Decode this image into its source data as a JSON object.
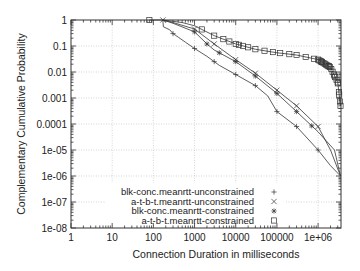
{
  "chart_data": {
    "type": "line",
    "title": "",
    "xlabel": "Connection Duration in milliseconds",
    "ylabel": "Complementary Cumulative Probability",
    "xscale": "log",
    "yscale": "log",
    "xlim": [
      1,
      3600000
    ],
    "ylim": [
      1e-08,
      1
    ],
    "grid": true,
    "legend_position": "bottom-center",
    "x_ticks": [
      {
        "value": 1,
        "label": "1"
      },
      {
        "value": 10,
        "label": "10"
      },
      {
        "value": 100,
        "label": "100"
      },
      {
        "value": 1000,
        "label": "1000"
      },
      {
        "value": 10000,
        "label": "10000"
      },
      {
        "value": 100000,
        "label": "100000"
      },
      {
        "value": 1000000,
        "label": "1e+06"
      }
    ],
    "y_ticks": [
      {
        "value": 1,
        "label": "1"
      },
      {
        "value": 0.1,
        "label": "0.1"
      },
      {
        "value": 0.01,
        "label": "0.01"
      },
      {
        "value": 0.001,
        "label": "0.001"
      },
      {
        "value": 0.0001,
        "label": "0.0001"
      },
      {
        "value": 1e-05,
        "label": "1e-05"
      },
      {
        "value": 1e-06,
        "label": "1e-06"
      },
      {
        "value": 1e-07,
        "label": "1e-07"
      },
      {
        "value": 1e-08,
        "label": "1e-08"
      }
    ],
    "series": [
      {
        "name": "blk-conc.meanrtt-unconstrained",
        "marker": "plus",
        "points": [
          [
            170,
            1
          ],
          [
            175,
            0.55
          ],
          [
            250,
            0.42
          ],
          [
            300,
            0.3
          ],
          [
            400,
            0.22
          ],
          [
            600,
            0.14
          ],
          [
            1000,
            0.08
          ],
          [
            2000,
            0.04
          ],
          [
            4000,
            0.018
          ],
          [
            10000,
            0.008
          ],
          [
            30000,
            0.003
          ],
          [
            60000,
            0.0012
          ],
          [
            100000,
            0.0003
          ],
          [
            300000,
            8e-05
          ],
          [
            1000000,
            1e-05
          ],
          [
            2000000,
            2.5e-06
          ],
          [
            3500000,
            1e-06
          ]
        ],
        "marker_x": [
          300,
          1000,
          3000,
          10000,
          30000,
          100000,
          300000,
          1000000
        ]
      },
      {
        "name": "a-t-b-t.meanrtt-unconstrained",
        "marker": "cross",
        "points": [
          [
            170,
            1
          ],
          [
            300,
            0.8
          ],
          [
            1000,
            0.45
          ],
          [
            3000,
            0.12
          ],
          [
            10000,
            0.03
          ],
          [
            30000,
            0.009
          ],
          [
            100000,
            0.002
          ],
          [
            300000,
            0.0005
          ],
          [
            1000000,
            8e-05
          ],
          [
            2000000,
            1e-05
          ],
          [
            3500000,
            1e-06
          ]
        ],
        "marker_x": [
          170,
          1000,
          3000,
          10000,
          30000,
          100000,
          300000,
          1000000
        ]
      },
      {
        "name": "blk-conc.meanrtt-constrained",
        "marker": "star",
        "points": [
          [
            170,
            1
          ],
          [
            300,
            0.75
          ],
          [
            1000,
            0.35
          ],
          [
            2000,
            0.12
          ],
          [
            3000,
            0.07
          ],
          [
            10000,
            0.025
          ],
          [
            30000,
            0.007
          ],
          [
            100000,
            0.0015
          ],
          [
            300000,
            0.0003
          ],
          [
            1000000,
            5e-05
          ],
          [
            2500000,
            1e-05
          ],
          [
            3500000,
            1e-06
          ]
        ],
        "marker_x": [
          1000,
          2000,
          4000,
          10000,
          30000,
          100000,
          300000,
          700000
        ]
      },
      {
        "name": "a-t-b-t.meanrtt-constrained",
        "marker": "square",
        "points": [
          [
            80,
            1
          ],
          [
            170,
            1
          ],
          [
            500,
            0.8
          ],
          [
            1000,
            0.6
          ],
          [
            3000,
            0.25
          ],
          [
            10000,
            0.12
          ],
          [
            30000,
            0.075
          ],
          [
            100000,
            0.055
          ],
          [
            300000,
            0.045
          ],
          [
            1000000,
            0.03
          ],
          [
            2000000,
            0.015
          ],
          [
            3000000,
            0.004
          ],
          [
            3500000,
            0.0005
          ]
        ],
        "marker_x": [
          80,
          1500,
          3000,
          5000,
          7000,
          10000,
          12000,
          15000,
          20000,
          30000,
          50000,
          80000,
          120000,
          200000,
          300000,
          500000,
          800000,
          1200000,
          1800000,
          2500000,
          3000000,
          3200000,
          3400000
        ]
      }
    ]
  }
}
